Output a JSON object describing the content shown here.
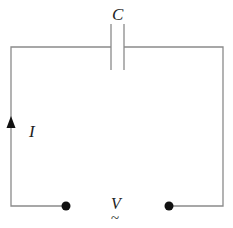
{
  "diagram": {
    "type": "circuit",
    "title": "",
    "components": {
      "capacitor": {
        "label": "C"
      },
      "current": {
        "label": "I",
        "direction": "up"
      },
      "source": {
        "label": "V",
        "symbol": "~"
      }
    },
    "colors": {
      "wire": "#8a8a8a",
      "terminal": "#111111",
      "text": "#222222"
    }
  }
}
